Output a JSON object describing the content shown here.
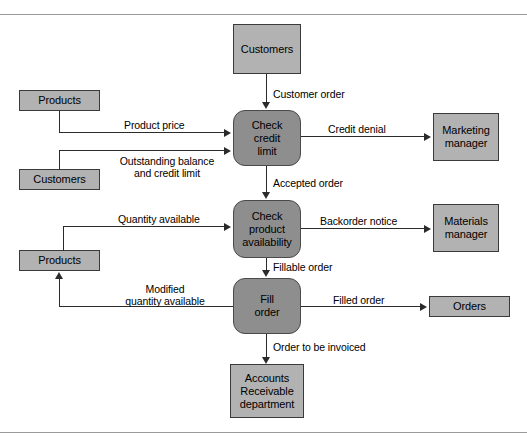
{
  "diagram": {
    "colors": {
      "entity_fill": "#b2b2b2",
      "process_fill": "#8e8e8e",
      "store_fill": "#b2b2b2",
      "line": "#2b2b2b",
      "rule": "#9a9a9a",
      "background": "#ffffff"
    },
    "entities": [
      {
        "id": "customers_entity",
        "label": "Customers"
      },
      {
        "id": "marketing_manager",
        "label": "Marketing\nmanager"
      },
      {
        "id": "materials_manager",
        "label": "Materials\nmanager"
      },
      {
        "id": "accounts_receivable",
        "label": "Accounts\nReceivable\ndepartment"
      }
    ],
    "processes": [
      {
        "id": "check_credit_limit",
        "label": "Check\ncredit\nlimit"
      },
      {
        "id": "check_product_availability",
        "label": "Check\nproduct\navailability"
      },
      {
        "id": "fill_order",
        "label": "Fill\norder"
      }
    ],
    "stores": [
      {
        "id": "products_store_top",
        "label": "Products"
      },
      {
        "id": "customers_store",
        "label": "Customers"
      },
      {
        "id": "products_store_bottom",
        "label": "Products"
      },
      {
        "id": "orders_store",
        "label": "Orders"
      }
    ],
    "flows": [
      {
        "id": "customer_order",
        "label": "Customer order"
      },
      {
        "id": "product_price",
        "label": "Product price"
      },
      {
        "id": "outstanding_balance",
        "label": "Outstanding balance\nand credit limit"
      },
      {
        "id": "credit_denial",
        "label": "Credit denial"
      },
      {
        "id": "accepted_order",
        "label": "Accepted order"
      },
      {
        "id": "quantity_available",
        "label": "Quantity available"
      },
      {
        "id": "backorder_notice",
        "label": "Backorder notice"
      },
      {
        "id": "fillable_order",
        "label": "Fillable order"
      },
      {
        "id": "modified_quantity_available",
        "label": "Modified\nquantity available"
      },
      {
        "id": "filled_order",
        "label": "Filled order"
      },
      {
        "id": "order_to_be_invoiced",
        "label": "Order to be invoiced"
      }
    ]
  }
}
